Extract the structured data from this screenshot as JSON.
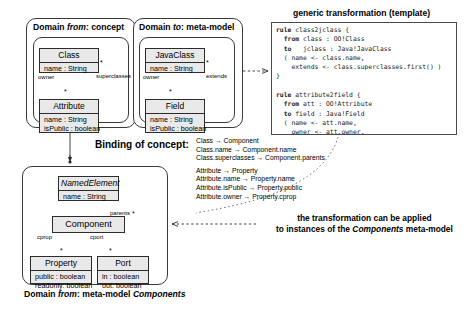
{
  "figure": {
    "title_domain_from_concept": "Domain from: concept",
    "title_domain_to_metamodel": "Domain to: meta-model",
    "template_title": "generic transformation (template)",
    "binding_label": "Binding of concept:",
    "lower_caption": "Domain from: meta-model Components",
    "note_line1": "the transformation can be applied",
    "note_line2": "to instances of the Components meta-model"
  },
  "domain_from_concept": {
    "header_prefix": "Domain ",
    "header_italic": "from",
    "header_suffix": ": concept",
    "classes": [
      {
        "name": "Class",
        "attrs": [
          "name : String"
        ]
      },
      {
        "name": "Attribute",
        "attrs": [
          "name : String",
          "isPublic : boolean"
        ]
      }
    ],
    "assoc_superclasses": "superclasses",
    "assoc_owner": "owner",
    "mult_superclasses": "*",
    "mult_owner": "*"
  },
  "domain_to_metamodel": {
    "header_prefix": "Domain ",
    "header_italic": "to",
    "header_suffix": ": meta-model",
    "classes": [
      {
        "name": "JavaClass",
        "attrs": [
          "name : String"
        ]
      },
      {
        "name": "Field",
        "attrs": [
          "name : String",
          "isPublic : boolean"
        ]
      }
    ],
    "assoc_extends": "extends",
    "assoc_owner": "owner",
    "mult_extends": "*",
    "mult_owner": "*"
  },
  "template_code": {
    "lines": [
      {
        "kw": "rule",
        "rest": " class2jclass {"
      },
      {
        "kw": "  from",
        "rest": " class : OO!Class"
      },
      {
        "kw": "  to",
        "rest": "   jclass : Java!JavaClass"
      },
      {
        "kw": "",
        "rest": "  ( name <- class.name,"
      },
      {
        "kw": "",
        "rest": "    extends <- class.superclasses.first() )"
      },
      {
        "kw": "",
        "rest": "}"
      },
      {
        "kw": "",
        "rest": ""
      },
      {
        "kw": "rule",
        "rest": " attribute2field {"
      },
      {
        "kw": "  from",
        "rest": " att : OO!Attribute"
      },
      {
        "kw": "  to",
        "rest": " field : Java!Field"
      },
      {
        "kw": "",
        "rest": "  ( name <- att.name,"
      },
      {
        "kw": "",
        "rest": "    owner <- att.owner,"
      },
      {
        "kw": "",
        "rest": "    isPublic <- att.isPublic )"
      },
      {
        "kw": "",
        "rest": "}"
      }
    ]
  },
  "binding": {
    "label": "Binding of concept:",
    "mappings_group1": [
      "Class → Component",
      "Class.name → Component.name",
      "Class.superclasses → Component.parents"
    ],
    "mappings_group2": [
      "Attribute → Property",
      "Attribute.name → Property.name",
      "Attribute.isPublic → Property.public",
      "Attribute.owner → Property.cprop"
    ]
  },
  "components_metamodel": {
    "caption_prefix": "Domain ",
    "caption_italic1": "from",
    "caption_mid": ": meta-model ",
    "caption_italic2": "Components",
    "classes": [
      {
        "name": "NamedElement",
        "abstract": true,
        "attrs": [
          "name : String"
        ]
      },
      {
        "name": "Component",
        "abstract": false,
        "attrs": []
      },
      {
        "name": "Property",
        "abstract": false,
        "attrs": [
          "public : boolean",
          "readonly: boolean"
        ]
      },
      {
        "name": "Port",
        "abstract": false,
        "attrs": [
          "in : boolean",
          "out: boolean"
        ]
      }
    ],
    "assoc_parents": "parents",
    "assoc_cprop": "cprop",
    "assoc_cport": "cport",
    "mult_parents": "*",
    "mult_cprop": "*",
    "mult_cport": "*"
  },
  "colors": {
    "class_fill": "#e9e9e9",
    "stroke": "#2c2c2c",
    "background": "#ffffff"
  }
}
